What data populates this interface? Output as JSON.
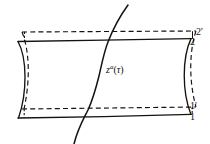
{
  "figure": {
    "name": "deformed-spacelike-strip-with-worldline",
    "background_color": "#ffffff",
    "ink_color": "#15120f",
    "labels": {
      "corner_2_prime": "2'",
      "corner_2": "2",
      "corner_1_prime": "1'",
      "corner_1": "1",
      "worldline_symbol": "z",
      "worldline_superscript": "a",
      "worldline_open_paren": "(",
      "worldline_argument": "τ",
      "worldline_close_paren": ")"
    },
    "elements": {
      "dashed_rectangle": "dashed-rectangle-undeformed-surface",
      "solid_strip": "solid-deformed-strip",
      "worldline_curve": "worldline-curve",
      "top_solid_edge": "top-solid-edge",
      "bottom_solid_edge": "bottom-solid-edge",
      "left_concave_edge": "left-concave-edge",
      "right_concave_edge": "right-concave-edge",
      "top_left_tick": "top-left-tick",
      "top_right_tick": "top-right-tick",
      "bottom_left_tick": "bottom-left-tick",
      "bottom_right_tick": "bottom-right-tick"
    },
    "geometry": {
      "dashed_rect": {
        "x": 22,
        "y": 32,
        "width": 173,
        "height": 76
      },
      "solid_top_y": 40,
      "solid_bottom_y": 117,
      "solid_left_x": 18,
      "solid_right_x": 191,
      "worldline_start": {
        "x": 74,
        "y": 144
      },
      "worldline_end": {
        "x": 128,
        "y": 5
      }
    }
  }
}
